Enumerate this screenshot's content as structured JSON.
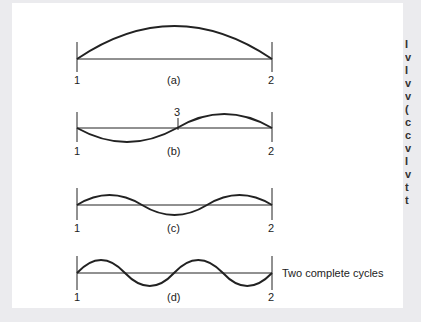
{
  "figure": {
    "panels": [
      {
        "id": "a",
        "caption": "(a)",
        "left_node": "1",
        "right_node": "2",
        "half_cycles": 1
      },
      {
        "id": "b",
        "caption": "(b)",
        "left_node": "1",
        "right_node": "2",
        "mid_node": "3",
        "half_cycles": 2
      },
      {
        "id": "c",
        "caption": "(c)",
        "left_node": "1",
        "right_node": "2",
        "half_cycles": 3
      },
      {
        "id": "d",
        "caption": "(d)",
        "left_node": "1",
        "right_node": "2",
        "half_cycles": 4,
        "annotation": "Two complete cycles"
      }
    ]
  },
  "side_text": {
    "clipped_chars": [
      "I",
      "v",
      "I",
      "v",
      "v",
      "(",
      "c",
      "c",
      "v",
      "I",
      "v",
      "t",
      "t"
    ]
  }
}
